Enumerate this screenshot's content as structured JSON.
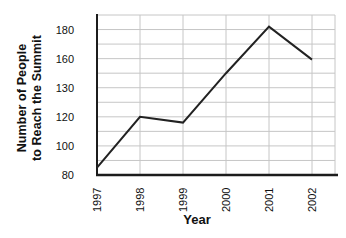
{
  "chart_data": {
    "type": "line",
    "title": "",
    "xlabel": "Year",
    "ylabel": "Number of People to Reach the Summit",
    "ylabel_lines": [
      "Number of People",
      "to Reach the Summit"
    ],
    "categories": [
      "1997",
      "1998",
      "1999",
      "2000",
      "2001",
      "2002"
    ],
    "values": [
      85,
      120,
      116,
      145,
      182,
      159
    ],
    "y_ticks": [
      {
        "label": "80",
        "value": 80
      },
      {
        "label": "100",
        "value": 100
      },
      {
        "label": "120",
        "value": 120
      },
      {
        "label": "130",
        "value": 130
      },
      {
        "label": "160",
        "value": 160
      },
      {
        "label": "180",
        "value": 180
      }
    ],
    "grid": true,
    "legend": "none",
    "colors": {
      "background": "#ffffff",
      "grid": "#c6c6c6",
      "axis": "#1c1c1c",
      "line": "#222222",
      "text": "#111111"
    }
  }
}
